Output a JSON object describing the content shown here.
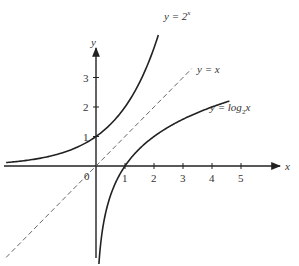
{
  "chart_data": {
    "type": "line",
    "title": "",
    "xlabel": "x",
    "ylabel": "y",
    "xlim": [
      -3.3,
      6.3
    ],
    "ylim": [
      -3.4,
      4.3
    ],
    "grid": false,
    "origin_label": "0",
    "x_ticks": [
      1,
      2,
      3,
      4,
      5
    ],
    "x_tick_labels": [
      "1",
      "2",
      "3",
      "4",
      "5"
    ],
    "y_ticks": [
      1,
      2,
      3
    ],
    "y_tick_labels": [
      "1",
      "2",
      "3"
    ],
    "series": [
      {
        "name": "y = 2^x",
        "label_text": "y = 2",
        "label_sup": "x",
        "style": "solid",
        "color": "#222222",
        "x": [
          -3.1,
          -2,
          -1,
          0,
          0.5,
          1,
          1.5,
          2,
          2.15
        ],
        "y": [
          0.117,
          0.25,
          0.5,
          1,
          1.414,
          2,
          2.828,
          4,
          4.44
        ]
      },
      {
        "name": "y = x",
        "label_text": "y = x",
        "style": "dashed",
        "color": "#555555",
        "x": [
          -3.1,
          3.3
        ],
        "y": [
          -3.1,
          3.3
        ]
      },
      {
        "name": "y = log2 x",
        "label_text": "y = log",
        "label_sub": "2",
        "label_tail": "x",
        "style": "solid",
        "color": "#222222",
        "x": [
          0.1,
          0.25,
          0.5,
          1,
          2,
          3,
          4,
          4.6
        ],
        "y": [
          -3.32,
          -2,
          -1,
          0,
          1,
          1.585,
          2,
          2.2
        ]
      }
    ]
  }
}
